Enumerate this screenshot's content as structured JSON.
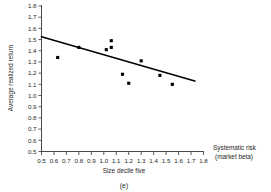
{
  "chart_data": {
    "type": "scatter",
    "title": "",
    "panel_label": "(e)",
    "xlabel": "Size decile five",
    "ylabel": "Average realized return",
    "x_axis_annotation_line1": "Systematic risk",
    "x_axis_annotation_line2": "(market beta)",
    "xlim": [
      0.5,
      1.8
    ],
    "ylim": [
      0.5,
      1.8
    ],
    "xticks": [
      0.5,
      0.6,
      0.7,
      0.8,
      0.9,
      1.0,
      1.1,
      1.2,
      1.3,
      1.4,
      1.5,
      1.6,
      1.7,
      1.8
    ],
    "yticks": [
      0.5,
      0.6,
      0.7,
      0.8,
      0.9,
      1.0,
      1.1,
      1.2,
      1.3,
      1.4,
      1.5,
      1.6,
      1.7,
      1.8
    ],
    "xtick_labels": [
      "0.5",
      "0.6",
      "0.7",
      "0.8",
      "0.9",
      "1.0",
      "1.1",
      "1.2",
      "1.3",
      "1.4",
      "1.5",
      "1.6",
      "1.7",
      "1.8"
    ],
    "ytick_labels": [
      "0.5",
      "0.6",
      "0.7",
      "0.8",
      "0.9",
      "1.0",
      "1.1",
      "1.2",
      "1.3",
      "1.4",
      "1.5",
      "1.6",
      "1.7",
      "1.8"
    ],
    "grid": false,
    "legend": null,
    "marker_style": "filled-square",
    "marker_color": "#000000",
    "points": [
      {
        "x": 0.63,
        "y": 1.34
      },
      {
        "x": 0.8,
        "y": 1.43
      },
      {
        "x": 1.02,
        "y": 1.41
      },
      {
        "x": 1.06,
        "y": 1.49
      },
      {
        "x": 1.06,
        "y": 1.43
      },
      {
        "x": 1.15,
        "y": 1.19
      },
      {
        "x": 1.2,
        "y": 1.11
      },
      {
        "x": 1.3,
        "y": 1.31
      },
      {
        "x": 1.45,
        "y": 1.18
      },
      {
        "x": 1.55,
        "y": 1.1
      }
    ],
    "fit_line": {
      "type": "linear-regression",
      "color": "#000000",
      "x_start": 0.5,
      "y_start": 1.525,
      "x_end": 1.73,
      "y_end": 1.13
    }
  }
}
